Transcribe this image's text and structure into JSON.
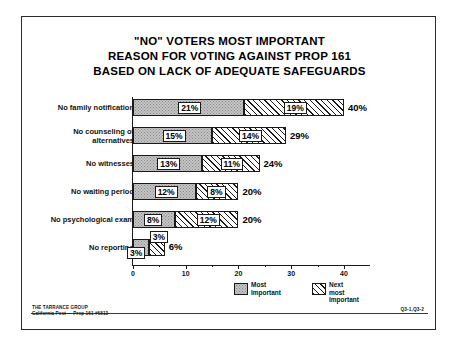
{
  "document": {
    "title_lines": [
      "\"NO\" VOTERS MOST IMPORTANT",
      "REASON FOR VOTING AGAINST PROP 161",
      "BASED ON LACK OF ADEQUATE SAFEGUARDS"
    ],
    "footer_left_line1": "THE TARRANCE GROUP",
    "footer_left_line2": "California Post — Prop 161 #6813",
    "footer_right": "Q3-1,Q3-2"
  },
  "legend": {
    "items": [
      {
        "label": "Most\nImportant",
        "pattern": "stipple-gray",
        "color": "#c4c4c4"
      },
      {
        "label": "Next most\nImportant",
        "pattern": "diagonal-hatch",
        "color": "#ffffff"
      }
    ]
  },
  "axis": {
    "ticks_major": [
      "0",
      "10",
      "20",
      "30",
      "40"
    ],
    "tick_values_major": [
      0,
      10,
      20,
      30,
      40
    ],
    "tick_values_minor": [
      5,
      15,
      25,
      35
    ]
  },
  "chart_data": {
    "type": "bar",
    "orientation": "horizontal",
    "stacked": true,
    "title": "\"NO\" VOTERS MOST IMPORTANT REASON FOR VOTING AGAINST PROP 161 BASED ON LACK OF ADEQUATE SAFEGUARDS",
    "subtitle": "",
    "xlabel": "",
    "ylabel": "",
    "xlim": [
      0,
      44
    ],
    "grid": false,
    "legend_position": "bottom",
    "categories": [
      "No family notification",
      "No counseling of alternatives",
      "No witnesses",
      "No waiting period",
      "No psychological exam",
      "No reporting"
    ],
    "series": [
      {
        "name": "Most Important",
        "values": [
          21,
          15,
          13,
          12,
          8,
          3
        ]
      },
      {
        "name": "Next most Important",
        "values": [
          19,
          14,
          11,
          8,
          12,
          3
        ]
      }
    ],
    "totals": [
      40,
      29,
      24,
      20,
      20,
      6
    ],
    "value_labels": {
      "most": [
        "21%",
        "15%",
        "13%",
        "12%",
        "8%",
        "3%"
      ],
      "next": [
        "19%",
        "14%",
        "11%",
        "8%",
        "12%",
        "3%"
      ],
      "total": [
        "40%",
        "29%",
        "24%",
        "20%",
        "20%",
        "6%"
      ]
    }
  }
}
